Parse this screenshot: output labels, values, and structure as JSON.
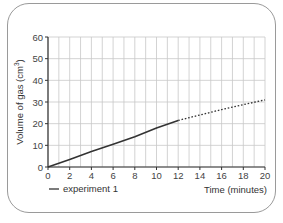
{
  "chart_data": {
    "type": "line",
    "title": "",
    "xlabel": "Time (minutes)",
    "ylabel": "Volume of gas (cm³)",
    "ylabel_base": "Volume of gas (cm",
    "ylabel_sup": "3",
    "ylabel_end": ")",
    "xlim": [
      0,
      20
    ],
    "ylim": [
      0,
      60
    ],
    "x_ticks": [
      0,
      2,
      4,
      6,
      8,
      10,
      12,
      14,
      16,
      18,
      20
    ],
    "y_ticks": [
      0,
      10,
      20,
      30,
      40,
      50,
      60
    ],
    "grid": true,
    "grid_x_step": 1,
    "grid_y_step": 10,
    "legend_position": "bottom-left",
    "series": [
      {
        "name": "experiment 1",
        "style": "solid",
        "color": "#333333",
        "x": [
          0,
          2,
          4,
          6,
          8,
          10,
          12
        ],
        "y": [
          0,
          3.5,
          7.2,
          10.5,
          14,
          18,
          21.5
        ]
      },
      {
        "name": "experiment 1 (extrapolated)",
        "style": "dotted",
        "color": "#333333",
        "x": [
          12,
          16,
          20
        ],
        "y": [
          21.5,
          26.5,
          31
        ]
      }
    ]
  },
  "legend": {
    "label": "experiment 1"
  },
  "colors": {
    "frame": "#9a9a9a",
    "grid": "#c8c8c8",
    "axis": "#333333",
    "line": "#333333"
  }
}
